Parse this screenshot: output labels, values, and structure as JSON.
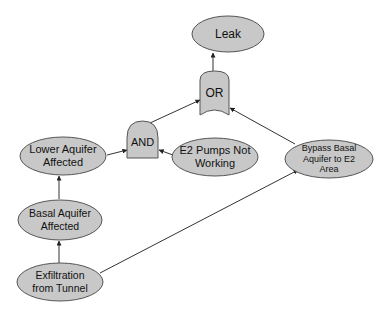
{
  "diagram": {
    "type": "fault-tree",
    "colors": {
      "node_fill": "#c8c8c8",
      "node_stroke": "#555555",
      "edge": "#333333",
      "background": "#ffffff"
    },
    "nodes": {
      "leak": {
        "line1": "Leak",
        "line2": "",
        "line3": "",
        "shape": "ellipse"
      },
      "or_gate": {
        "line1": "OR",
        "shape": "or-gate"
      },
      "and_gate": {
        "line1": "AND",
        "shape": "and-gate"
      },
      "lower_aquifer": {
        "line1": "Lower Aquifer",
        "line2": "Affected",
        "shape": "ellipse"
      },
      "e2_pumps": {
        "line1": "E2 Pumps Not",
        "line2": "Working",
        "shape": "ellipse"
      },
      "bypass": {
        "line1": "Bypass Basal",
        "line2": "Aquifer to E2",
        "line3": "Area",
        "shape": "ellipse"
      },
      "basal_aquifer": {
        "line1": "Basal Aquifer",
        "line2": "Affected",
        "shape": "ellipse"
      },
      "exfiltration": {
        "line1": "Exfiltration",
        "line2": "from Tunnel",
        "shape": "ellipse"
      }
    },
    "edges": [
      {
        "from": "or_gate",
        "to": "leak"
      },
      {
        "from": "and_gate",
        "to": "or_gate"
      },
      {
        "from": "bypass",
        "to": "or_gate"
      },
      {
        "from": "lower_aquifer",
        "to": "and_gate"
      },
      {
        "from": "e2_pumps",
        "to": "and_gate"
      },
      {
        "from": "basal_aquifer",
        "to": "lower_aquifer"
      },
      {
        "from": "exfiltration",
        "to": "basal_aquifer"
      },
      {
        "from": "exfiltration",
        "to": "bypass"
      }
    ]
  }
}
